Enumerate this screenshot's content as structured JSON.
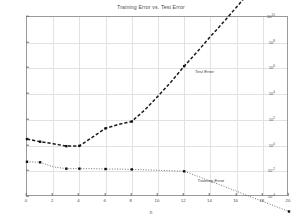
{
  "chart_data": {
    "type": "line",
    "title": "Training Error vs. Test Error",
    "xlabel": "n",
    "ylabel": "",
    "yscale": "log",
    "xscale": "linear",
    "xlim": [
      0,
      20
    ],
    "ylim": [
      0.0001,
      10000000000.0
    ],
    "grid": true,
    "legend_position": "inline-annotations",
    "x_ticks": [
      "0",
      "2",
      "4",
      "6",
      "8",
      "10",
      "12",
      "14",
      "16",
      "18",
      "20"
    ],
    "x_tick_values": [
      0,
      2,
      4,
      6,
      8,
      10,
      12,
      14,
      16,
      18,
      20
    ],
    "y_ticks": [
      "10^10",
      "10^8",
      "10^6",
      "10^4",
      "10^2",
      "10^0",
      "10^-2",
      "10^-4"
    ],
    "y_tick_exponents": [
      10,
      8,
      6,
      4,
      2,
      0,
      -2,
      -4
    ],
    "series": [
      {
        "name": "Test Error",
        "style": "dashed",
        "marker": "square",
        "color": "#1a1a1a",
        "x": [
          0,
          1,
          2,
          3,
          4,
          5,
          6,
          7,
          8,
          9,
          10,
          11,
          12,
          13,
          14,
          15,
          16,
          17,
          18,
          19,
          20
        ],
        "y": [
          3.2,
          2.0,
          1.4,
          0.9,
          0.95,
          4.5,
          22,
          45,
          75,
          600,
          7000,
          90000,
          1500000,
          20000000,
          300000000,
          4000000000,
          60000000000,
          900000000000,
          12000000000000,
          180000000000000,
          2500000000000000
        ]
      },
      {
        "name": "Training Error",
        "style": "dotted",
        "marker": "square",
        "color": "#4d4d4d",
        "x": [
          0,
          1,
          2,
          3,
          4,
          5,
          6,
          7,
          8,
          9,
          10,
          11,
          12,
          13,
          14,
          15,
          16,
          17,
          18,
          19,
          20
        ],
        "y": [
          0.055,
          0.05,
          0.022,
          0.016,
          0.016,
          0.016,
          0.015,
          0.015,
          0.014,
          0.013,
          0.012,
          0.011,
          0.01,
          0.0042,
          0.0017,
          0.0007,
          0.00028,
          0.00011,
          4.5e-05,
          1.8e-05,
          7.5e-06
        ]
      }
    ],
    "annotations": [
      {
        "text": "Test Error",
        "x": 12.9,
        "y": 450000.0
      },
      {
        "text": "Training Error",
        "x": 13.1,
        "y": 0.00165
      }
    ]
  }
}
